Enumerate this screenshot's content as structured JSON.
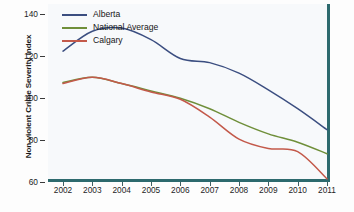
{
  "chart_data": {
    "type": "line",
    "title": "",
    "xlabel": "",
    "ylabel": "Non-violent Crime Severity Index",
    "x": [
      2002,
      2003,
      2004,
      2005,
      2006,
      2007,
      2008,
      2009,
      2010,
      2011
    ],
    "xtick_labels": [
      "2002",
      "2003",
      "2004",
      "2005",
      "2006",
      "2007",
      "2008",
      "2009",
      "2010",
      "2011"
    ],
    "ytick_labels": [
      "140",
      "120",
      "100",
      "80",
      "60"
    ],
    "yticks": [
      140,
      120,
      100,
      80,
      60
    ],
    "xlim": [
      2002,
      2011
    ],
    "ylim": [
      60,
      145
    ],
    "grid": false,
    "legend_position": "top-left",
    "series": [
      {
        "name": "Alberta",
        "color": "#3b4e80",
        "values": [
          122.5,
          132.0,
          133.5,
          128.0,
          119.0,
          117.0,
          112.0,
          104.0,
          95.0,
          85.0
        ]
      },
      {
        "name": "National Average",
        "color": "#6f8f3a",
        "values": [
          107.5,
          110.0,
          107.0,
          103.5,
          100.0,
          95.0,
          88.5,
          83.0,
          79.0,
          73.5
        ]
      },
      {
        "name": "Calgary",
        "color": "#c3594a",
        "values": [
          107.0,
          110.0,
          107.0,
          103.0,
          99.5,
          91.0,
          80.5,
          76.0,
          74.5,
          61.5
        ]
      }
    ]
  },
  "legend": {
    "items": [
      {
        "label": "Alberta",
        "color": "#3b4e80"
      },
      {
        "label": "National Average",
        "color": "#6f8f3a"
      },
      {
        "label": "Calgary",
        "color": "#c3594a"
      }
    ]
  },
  "axes": {
    "y_title": "Non-violent Crime Severity Index"
  },
  "colors": {
    "frame": "#2d6a6e",
    "plot_background": "#f7f9fb",
    "page_background": "#ffffff"
  }
}
